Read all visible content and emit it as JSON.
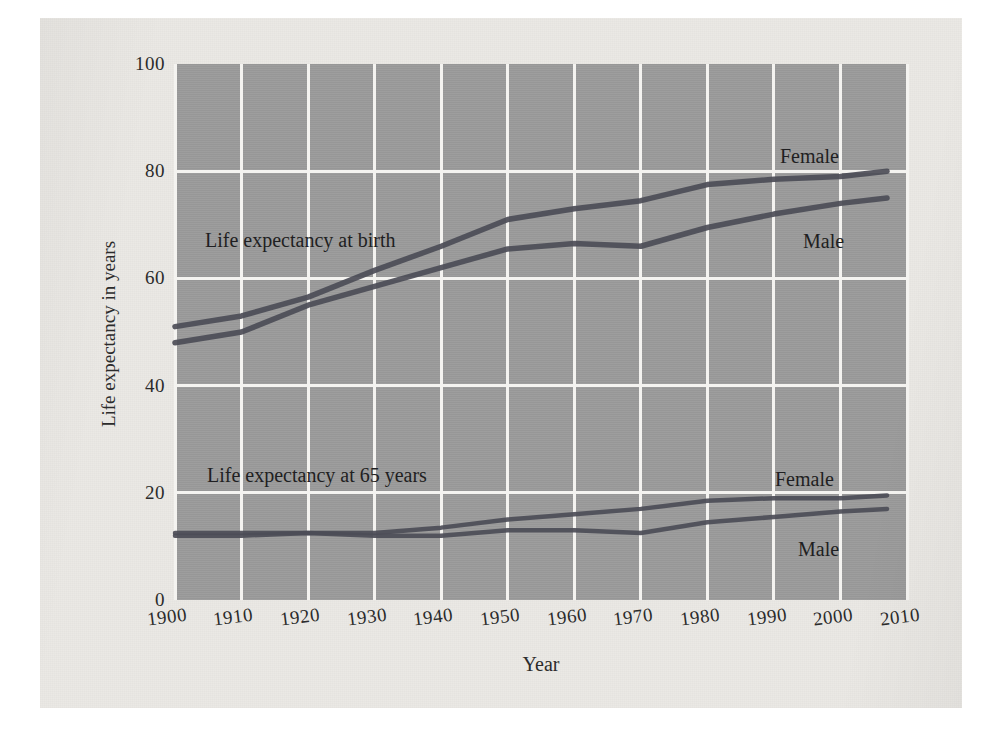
{
  "figure": {
    "y_axis_title": "Life expectancy in years",
    "x_axis_title": "Year",
    "annotations": {
      "birth_group": "Life expectancy at birth",
      "at65_group": "Life expectancy at 65 years",
      "birth_female": "Female",
      "birth_male": "Male",
      "at65_female": "Female",
      "at65_male": "Male"
    },
    "colors": {
      "plot_background": "#9a9a9a",
      "paper_background": "#ebe9e5",
      "gridline": "#f4f3f0",
      "line": "#4c4d57",
      "text": "#2b2b2b"
    }
  },
  "chart_data": {
    "type": "line",
    "title": "",
    "subtitle": "",
    "xlabel": "Year",
    "ylabel": "Life expectancy in years",
    "xlim": [
      1900,
      2010
    ],
    "ylim": [
      0,
      100
    ],
    "grid": true,
    "legend": "inline-annotations",
    "xticks": [
      1900,
      1910,
      1920,
      1930,
      1940,
      1950,
      1960,
      1970,
      1980,
      1990,
      2000,
      2010
    ],
    "yticks": [
      0,
      20,
      40,
      60,
      80,
      100
    ],
    "x": [
      1900,
      1910,
      1920,
      1930,
      1940,
      1950,
      1960,
      1970,
      1980,
      1990,
      2000,
      2007
    ],
    "series": [
      {
        "name": "Life expectancy at birth — Female",
        "group": "Life expectancy at birth",
        "sex": "Female",
        "values": [
          51.0,
          53.0,
          56.5,
          61.5,
          66.0,
          71.0,
          73.0,
          74.5,
          77.5,
          78.5,
          79.0,
          80.0
        ]
      },
      {
        "name": "Life expectancy at birth — Male",
        "group": "Life expectancy at birth",
        "sex": "Male",
        "values": [
          48.0,
          50.0,
          55.0,
          58.5,
          62.0,
          65.5,
          66.5,
          66.0,
          69.5,
          72.0,
          74.0,
          75.0
        ]
      },
      {
        "name": "Life expectancy at 65 years — Female",
        "group": "Life expectancy at 65 years",
        "sex": "Female",
        "values": [
          12.5,
          12.5,
          12.5,
          12.5,
          13.5,
          15.0,
          16.0,
          17.0,
          18.5,
          19.0,
          19.0,
          19.5
        ]
      },
      {
        "name": "Life expectancy at 65 years — Male",
        "group": "Life expectancy at 65 years",
        "sex": "Male",
        "values": [
          12.0,
          12.0,
          12.5,
          12.0,
          12.0,
          13.0,
          13.0,
          12.5,
          14.5,
          15.5,
          16.5,
          17.0
        ]
      }
    ]
  }
}
